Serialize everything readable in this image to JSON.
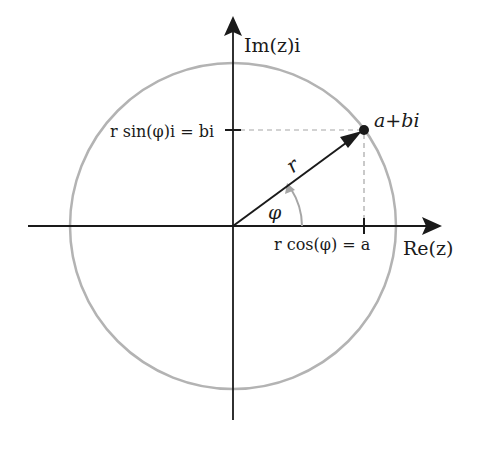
{
  "diagram": {
    "type": "complex-plane-polar-form",
    "colors": {
      "axis": "#1a1a1a",
      "circle": "#b3b3b3",
      "vector": "#1a1a1a",
      "angle_arc": "#a6a6a6",
      "dashed": "#a6a6a6",
      "background": "#ffffff"
    },
    "labels": {
      "imag_axis": "Im(z)i",
      "real_axis": "Re(z)",
      "point": "a+bi",
      "radius": "r",
      "angle": "φ",
      "imag_projection": "r sin(φ)i = bi",
      "real_projection": "r cos(φ) = a"
    },
    "geometry": {
      "origin": [
        233,
        226
      ],
      "point": [
        364,
        130
      ],
      "circle_radius": 163
    }
  }
}
